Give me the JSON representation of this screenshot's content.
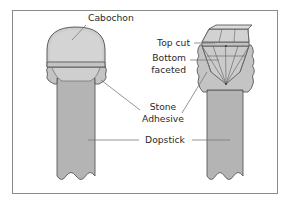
{
  "figure": {
    "frame": {
      "border_color": "#8a8a8a",
      "background_color": "#ffffff"
    },
    "colors": {
      "stone_fill": "#c9c9c9",
      "stone_fill_light": "#d4d4d4",
      "stone_fill_dark": "#bdbdbd",
      "adhesive_fill": "#c4c4c4",
      "dopstick_fill": "#b4b4b4",
      "outline": "#5a5a5a",
      "facet_line": "#6b6b6b",
      "leader_line": "#7a7a7a",
      "text": "#2a2a2a"
    },
    "labels": [
      {
        "id": "cabochon",
        "text": "Cabochon",
        "x": 88,
        "y": 21
      },
      {
        "id": "top-cut",
        "text": "Top cut",
        "x": 163,
        "y": 46
      },
      {
        "id": "bottom",
        "text": "Bottom",
        "x": 155,
        "y": 61
      },
      {
        "id": "faceted",
        "text": "faceted",
        "x": 155,
        "y": 73
      },
      {
        "id": "stone",
        "text": "Stone",
        "x": 158,
        "y": 108
      },
      {
        "id": "adhesive",
        "text": "Adhesive",
        "x": 148,
        "y": 120
      },
      {
        "id": "dopstick",
        "text": "Dopstick",
        "x": 146,
        "y": 143
      }
    ],
    "parts": {
      "left_assembly": {
        "name": "cabochon-on-dopstick",
        "stone_type": "Cabochon",
        "stone_shape": "domed cabochon",
        "has_adhesive": true,
        "has_dopstick": true
      },
      "right_assembly": {
        "name": "faceted-stone-on-dopstick",
        "stone_type": "Faceted stone",
        "stone_shape": "table top cut with faceted pavilion",
        "has_adhesive": true,
        "has_dopstick": true
      }
    }
  }
}
